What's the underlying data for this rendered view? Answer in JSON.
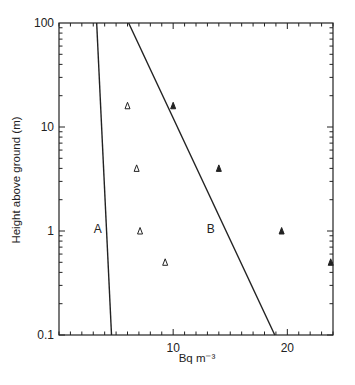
{
  "chart_data": {
    "type": "scatter",
    "title": "",
    "xlabel": "Bq m⁻³",
    "ylabel": "Height above ground (m)",
    "xlim": [
      0,
      24
    ],
    "ylim": [
      0.1,
      100
    ],
    "yscale": "log",
    "grid": false,
    "legend": "none",
    "x_ticks": [
      {
        "value": 10,
        "label": "10"
      },
      {
        "value": 20,
        "label": "20"
      }
    ],
    "y_ticks": [
      {
        "value": 0.1,
        "label": "0.1"
      },
      {
        "value": 1,
        "label": "1"
      },
      {
        "value": 10,
        "label": "10"
      },
      {
        "value": 100,
        "label": "100"
      }
    ],
    "series": [
      {
        "name": "open triangles",
        "marker": "open-triangle",
        "points": [
          {
            "x": 6.0,
            "y": 16
          },
          {
            "x": 6.8,
            "y": 4
          },
          {
            "x": 7.1,
            "y": 1
          },
          {
            "x": 9.3,
            "y": 0.5
          }
        ]
      },
      {
        "name": "filled triangles",
        "marker": "filled-triangle",
        "points": [
          {
            "x": 10.0,
            "y": 16
          },
          {
            "x": 14.0,
            "y": 4
          },
          {
            "x": 19.5,
            "y": 1
          },
          {
            "x": 23.8,
            "y": 0.5
          }
        ]
      }
    ],
    "lines": [
      {
        "label": "A",
        "from": {
          "x": 3.3,
          "y": 100
        },
        "to": {
          "x": 4.6,
          "y": 0.1
        },
        "label_pos": {
          "x": 3.4,
          "y": 1.05
        }
      },
      {
        "label": "B",
        "from": {
          "x": 6.1,
          "y": 100
        },
        "to": {
          "x": 18.9,
          "y": 0.1
        },
        "label_pos": {
          "x": 13.3,
          "y": 1.05
        }
      }
    ],
    "colors": {
      "axis": "#222222",
      "marker": "#222222",
      "background": "#ffffff"
    }
  }
}
